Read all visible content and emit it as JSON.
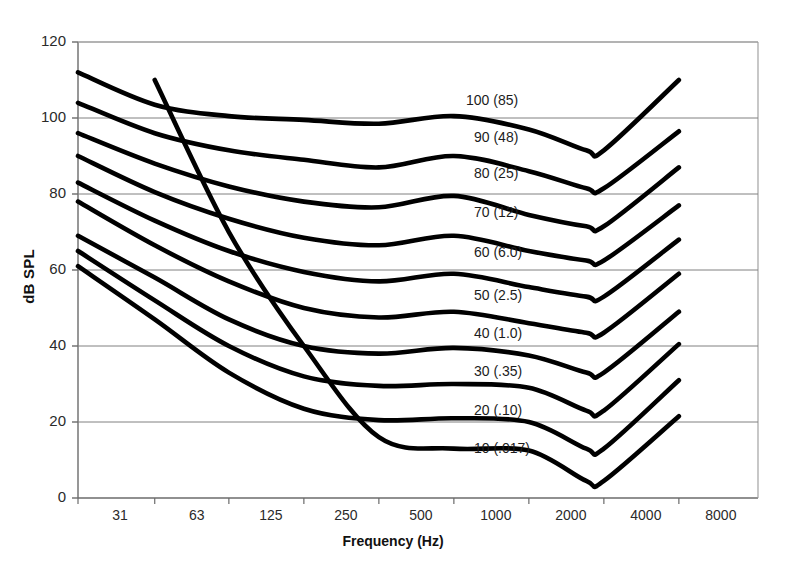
{
  "chart_data": {
    "type": "line",
    "title": "",
    "xlabel": "Frequency (Hz)",
    "ylabel": "dB SPL",
    "xscale": "log",
    "x_tick_labels": [
      "31",
      "63",
      "125",
      "250",
      "500",
      "1000",
      "2000",
      "4000",
      "8000"
    ],
    "x_tick_values": [
      31,
      63,
      125,
      250,
      500,
      1000,
      2000,
      4000,
      8000
    ],
    "y_tick_labels": [
      "0",
      "20",
      "40",
      "60",
      "80",
      "100",
      "120"
    ],
    "y_tick_values": [
      0,
      20,
      40,
      60,
      80,
      100,
      120
    ],
    "ylim": [
      0,
      120
    ],
    "grid": "horizontal-major",
    "legend": "inline-labels",
    "line_color": "#000000",
    "grid_color": "#808080",
    "axis_color": "#6b6b6b",
    "x": [
      31,
      63,
      125,
      250,
      500,
      1000,
      2000,
      3400,
      4000,
      8000
    ],
    "series": [
      {
        "name": "100 (85)",
        "label": "100 (85)",
        "phon": 100,
        "sone": 85,
        "values": [
          112,
          103.5,
          100.5,
          99.5,
          98.5,
          100.5,
          97,
          91.5,
          91.5,
          110
        ]
      },
      {
        "name": "90 (48)",
        "label": "90 (48)",
        "phon": 90,
        "sone": 48,
        "values": [
          104,
          96,
          91.5,
          89,
          87,
          90,
          86,
          81.5,
          81.5,
          96.5
        ]
      },
      {
        "name": "80 (25)",
        "label": "80 (25)",
        "phon": 80,
        "sone": 25,
        "values": [
          96,
          88,
          82,
          78,
          76.5,
          79.5,
          74.5,
          71.5,
          71.5,
          87
        ]
      },
      {
        "name": "70 (12)",
        "label": "70 (12)",
        "phon": 70,
        "sone": 12,
        "values": [
          90,
          80.5,
          73.5,
          68.5,
          66.5,
          69,
          65,
          62.5,
          62.5,
          77
        ]
      },
      {
        "name": "60 (6.0)",
        "label": "60 (6.0)",
        "phon": 60,
        "sone": 6.0,
        "values": [
          83,
          73,
          65,
          59.5,
          57,
          59,
          55.5,
          53,
          53,
          68
        ]
      },
      {
        "name": "50 (2.5)",
        "label": "50 (2.5)",
        "phon": 50,
        "sone": 2.5,
        "values": [
          78,
          66.5,
          57,
          50,
          47.5,
          49,
          46,
          43.5,
          43.5,
          59
        ]
      },
      {
        "name": "40 (1.0)",
        "label": "40 (1.0)",
        "phon": 40,
        "sone": 1.0,
        "values": [
          69,
          58,
          47,
          40,
          38,
          39.5,
          37.5,
          33,
          33,
          49
        ]
      },
      {
        "name": "30 (.35)",
        "label": "30 (.35)",
        "phon": 30,
        "sone": 0.35,
        "values": [
          65,
          52,
          40,
          32,
          29.5,
          30,
          29,
          23,
          23,
          40.5
        ]
      },
      {
        "name": "20 (.10)",
        "label": "20 (.10)",
        "phon": 20,
        "sone": 0.1,
        "values": [
          61,
          47,
          33,
          23.5,
          20.5,
          21,
          20,
          13,
          13,
          31
        ]
      },
      {
        "name": "10 (.017)",
        "label": "10 (.017)",
        "phon": 10,
        "sone": 0.017,
        "values": [
          null,
          110,
          70,
          40,
          16,
          13,
          12.5,
          4.5,
          4.5,
          21.5
        ]
      }
    ],
    "annotations": [
      {
        "text": "100 (85)",
        "x_px": 466,
        "y_px": 92
      },
      {
        "text": "90 (48)",
        "x_px": 474,
        "y_px": 129
      },
      {
        "text": "80 (25)",
        "x_px": 474,
        "y_px": 165
      },
      {
        "text": "70 (12)",
        "x_px": 474,
        "y_px": 204
      },
      {
        "text": "60 (6.0)",
        "x_px": 474,
        "y_px": 244
      },
      {
        "text": "50 (2.5)",
        "x_px": 474,
        "y_px": 287
      },
      {
        "text": "40 (1.0)",
        "x_px": 474,
        "y_px": 325
      },
      {
        "text": "30 (.35)",
        "x_px": 474,
        "y_px": 363
      },
      {
        "text": "20 (.10)",
        "x_px": 474,
        "y_px": 402
      },
      {
        "text": "10 (.017)",
        "x_px": 474,
        "y_px": 440
      }
    ]
  }
}
